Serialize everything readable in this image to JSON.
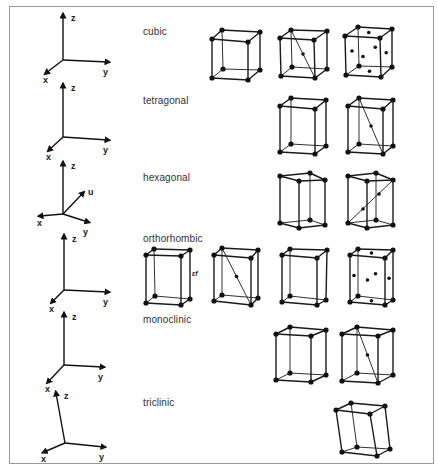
{
  "figure": {
    "title": "",
    "systems": [
      {
        "name": "cubic",
        "label_pos": [
          143,
          26
        ],
        "axes": {
          "origin": [
            63,
            60
          ],
          "z": [
            63,
            15
          ],
          "y": [
            108,
            62
          ],
          "x": [
            46,
            73
          ],
          "labels": {
            "z": "z",
            "y": "y",
            "x": "x"
          }
        },
        "cells": [
          "simple",
          "body-centered",
          "face-centered"
        ]
      },
      {
        "name": "tetragonal",
        "label_pos": [
          143,
          95
        ],
        "axes": {
          "origin": [
            63,
            137
          ],
          "z": [
            63,
            85
          ],
          "y": [
            108,
            140
          ],
          "x": [
            49,
            150
          ],
          "labels": {
            "z": "z",
            "y": "y",
            "x": "x"
          }
        },
        "cells": [
          "simple",
          "body-centered"
        ]
      },
      {
        "name": "hexagonal",
        "label_pos": [
          143,
          172
        ],
        "axes": {
          "origin": [
            63,
            214
          ],
          "z": [
            63,
            163
          ],
          "u": [
            83,
            193
          ],
          "y": [
            88,
            222
          ],
          "x": [
            40,
            216
          ],
          "labels": {
            "z": "z",
            "u": "u",
            "y": "y",
            "x": "x"
          }
        },
        "cells": [
          "simple",
          "hcp-interior"
        ]
      },
      {
        "name": "orthorhombic",
        "label_pos": [
          143,
          233
        ],
        "axes": {
          "origin": [
            64,
            290
          ],
          "z": [
            64,
            236
          ],
          "y": [
            108,
            292
          ],
          "x": [
            52,
            302
          ],
          "labels": {
            "z": "z",
            "y": "y",
            "x": "x"
          }
        },
        "cells": [
          "simple",
          "body-centered",
          "base-centered",
          "face-centered"
        ]
      },
      {
        "name": "monoclinic",
        "label_pos": [
          143,
          314
        ],
        "axes": {
          "origin": [
            64,
            365
          ],
          "z": [
            64,
            314
          ],
          "y": [
            103,
            367
          ],
          "x": [
            48,
            382
          ],
          "labels": {
            "z": "z",
            "y": "y",
            "x": "x"
          }
        },
        "cells": [
          "simple",
          "body-centered"
        ]
      },
      {
        "name": "triclinic",
        "label_pos": [
          143,
          397
        ],
        "axes": {
          "origin": [
            65,
            443
          ],
          "z": [
            56,
            393
          ],
          "y": [
            104,
            447
          ],
          "x": [
            44,
            452
          ],
          "labels": {
            "z": "z",
            "y": "y",
            "x": "x"
          }
        },
        "cells": [
          "simple"
        ]
      }
    ],
    "annotation": "ɛf"
  },
  "labels": {
    "cubic": "cubic",
    "tetragonal": "tetragonal",
    "hexagonal": "hexagonal",
    "orthorhombic": "orthorhombic",
    "monoclinic": "monoclinic",
    "triclinic": "triclinic",
    "annotation": "ɛf"
  },
  "cells": [
    {
      "system": "cubic",
      "type": "simple",
      "FTL": [
        212,
        39
      ],
      "FTR": [
        248,
        42
      ],
      "BTL": [
        222,
        30
      ],
      "BTR": [
        260,
        32
      ],
      "FBL": [
        212,
        78
      ],
      "FBR": [
        248,
        80
      ],
      "BBL": [
        223,
        69
      ],
      "BBR": [
        260,
        70
      ]
    },
    {
      "system": "cubic",
      "type": "body-centered",
      "FTL": [
        280,
        38
      ],
      "FTR": [
        314,
        40
      ],
      "BTL": [
        291,
        30
      ],
      "BTR": [
        327,
        31
      ],
      "FBL": [
        281,
        76
      ],
      "FBR": [
        315,
        78
      ],
      "BBL": [
        292,
        67
      ],
      "BBR": [
        327,
        69
      ]
    },
    {
      "system": "cubic",
      "type": "face-centered",
      "FTL": [
        345,
        36
      ],
      "FTR": [
        380,
        38
      ],
      "BTL": [
        358,
        27
      ],
      "BTR": [
        392,
        29
      ],
      "FBL": [
        346,
        75
      ],
      "FBR": [
        381,
        77
      ],
      "BBL": [
        359,
        66
      ],
      "BBR": [
        392,
        67
      ]
    },
    {
      "system": "tetragonal",
      "type": "simple",
      "FTL": [
        280,
        106
      ],
      "FTR": [
        315,
        109
      ],
      "BTL": [
        291,
        98
      ],
      "BTR": [
        326,
        100
      ],
      "FBL": [
        280,
        152
      ],
      "FBR": [
        315,
        154
      ],
      "BBL": [
        291,
        144
      ],
      "BBR": [
        326,
        146
      ]
    },
    {
      "system": "tetragonal",
      "type": "body-centered",
      "FTL": [
        348,
        106
      ],
      "FTR": [
        383,
        109
      ],
      "BTL": [
        359,
        98
      ],
      "BTR": [
        393,
        100
      ],
      "FBL": [
        348,
        152
      ],
      "FBR": [
        383,
        154
      ],
      "BBL": [
        359,
        144
      ],
      "BBR": [
        393,
        146
      ]
    },
    {
      "system": "orthorhombic",
      "type": "simple",
      "FTL": [
        146,
        255
      ],
      "FTR": [
        181,
        256
      ],
      "BTL": [
        154,
        249
      ],
      "BTR": [
        190,
        250
      ],
      "FBL": [
        146,
        303
      ],
      "FBR": [
        181,
        305
      ],
      "BBL": [
        155,
        296
      ],
      "BBR": [
        190,
        299
      ]
    },
    {
      "system": "orthorhombic",
      "type": "body-centered",
      "FTL": [
        214,
        255
      ],
      "FTR": [
        251,
        258
      ],
      "BTL": [
        222,
        248
      ],
      "BTR": [
        258,
        250
      ],
      "FBL": [
        214,
        301
      ],
      "FBR": [
        251,
        305
      ],
      "BBL": [
        222,
        295
      ],
      "BBR": [
        258,
        298
      ]
    },
    {
      "system": "orthorhombic",
      "type": "base-centered",
      "FTL": [
        282,
        255
      ],
      "FTR": [
        317,
        258
      ],
      "BTL": [
        290,
        249
      ],
      "BTR": [
        327,
        250
      ],
      "FBL": [
        282,
        302
      ],
      "FBR": [
        317,
        305
      ],
      "BBL": [
        290,
        296
      ],
      "BBR": [
        326,
        300
      ]
    },
    {
      "system": "orthorhombic",
      "type": "face-centered",
      "FTL": [
        350,
        255
      ],
      "FTR": [
        385,
        258
      ],
      "BTL": [
        358,
        249
      ],
      "BTR": [
        393,
        250
      ],
      "FBL": [
        350,
        302
      ],
      "FBR": [
        385,
        305
      ],
      "BBL": [
        358,
        296
      ],
      "BBR": [
        393,
        300
      ]
    },
    {
      "system": "monoclinic",
      "type": "simple",
      "FTL": [
        276,
        334
      ],
      "FTR": [
        311,
        336
      ],
      "BTL": [
        290,
        327
      ],
      "BTR": [
        326,
        330
      ],
      "FBL": [
        276,
        380
      ],
      "FBR": [
        311,
        382
      ],
      "BBL": [
        290,
        373
      ],
      "BBR": [
        326,
        375
      ]
    },
    {
      "system": "monoclinic",
      "type": "body-centered",
      "FTL": [
        342,
        334
      ],
      "FTR": [
        378,
        336
      ],
      "BTL": [
        357,
        327
      ],
      "BTR": [
        393,
        330
      ],
      "FBL": [
        342,
        381
      ],
      "FBR": [
        378,
        383
      ],
      "BBL": [
        357,
        373
      ],
      "BBR": [
        393,
        375
      ]
    },
    {
      "system": "triclinic",
      "type": "simple",
      "FTL": [
        336,
        410
      ],
      "FTR": [
        370,
        414
      ],
      "BTL": [
        351,
        403
      ],
      "BTR": [
        385,
        406
      ],
      "FBL": [
        342,
        452
      ],
      "FBR": [
        377,
        456
      ],
      "BBL": [
        357,
        447
      ],
      "BBR": [
        390,
        449
      ]
    }
  ],
  "hex_prisms": [
    {
      "type": "simple",
      "top": [
        [
          280,
          176
        ],
        [
          299,
          181
        ],
        [
          325,
          180
        ],
        [
          310,
          173
        ]
      ],
      "bottom": [
        [
          280,
          223
        ],
        [
          299,
          228
        ],
        [
          325,
          225
        ],
        [
          310,
          220
        ]
      ]
    },
    {
      "type": "hcp-interior",
      "top": [
        [
          348,
          176
        ],
        [
          367,
          181
        ],
        [
          393,
          180
        ],
        [
          376,
          173
        ]
      ],
      "bottom": [
        [
          348,
          223
        ],
        [
          367,
          228
        ],
        [
          393,
          225
        ],
        [
          376,
          220
        ]
      ],
      "diagonal": [
        [
          348,
          223
        ],
        [
          393,
          180
        ]
      ],
      "interior": [
        [
          363,
          209
        ],
        [
          379,
          194
        ]
      ]
    }
  ]
}
